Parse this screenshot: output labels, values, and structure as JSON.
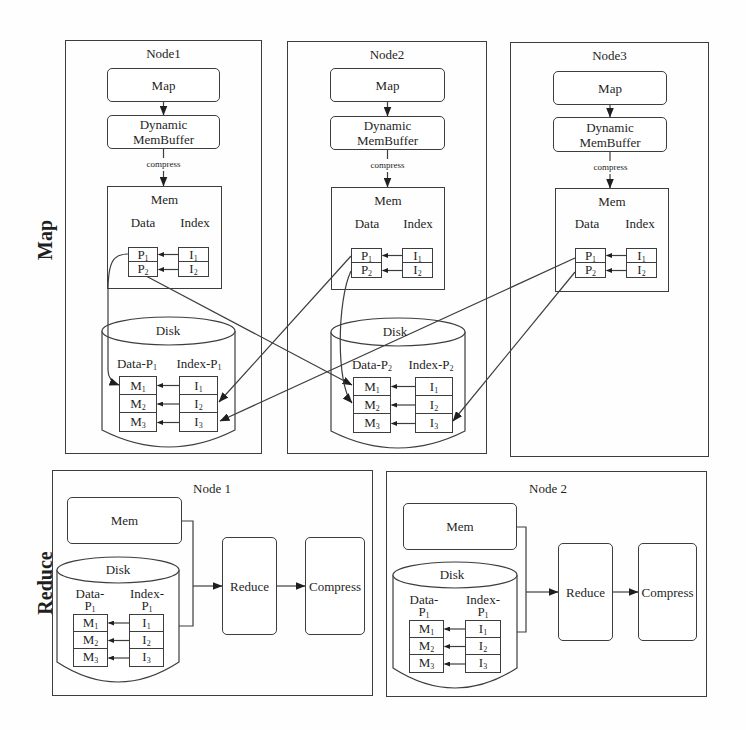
{
  "map_phase": {
    "label": "Map",
    "nodes": [
      {
        "title": "Node1",
        "map": "Map",
        "buffer": {
          "line1": "Dynamic",
          "line2": "MemBuffer"
        },
        "compress": "compress",
        "mem": {
          "title": "Mem",
          "data_label": "Data",
          "index_label": "Index",
          "data": [
            {
              "base": "P",
              "sub": "1"
            },
            {
              "base": "P",
              "sub": "2"
            }
          ],
          "index": [
            {
              "base": "I",
              "sub": "1"
            },
            {
              "base": "I",
              "sub": "2"
            }
          ]
        },
        "disk": {
          "title": "Disk",
          "data_label": {
            "base": "Data-P",
            "sub": "1"
          },
          "index_label": {
            "base": "Index-P",
            "sub": "1"
          },
          "data": [
            {
              "base": "M",
              "sub": "1"
            },
            {
              "base": "M",
              "sub": "2"
            },
            {
              "base": "M",
              "sub": "3"
            }
          ],
          "index": [
            {
              "base": "I",
              "sub": "1"
            },
            {
              "base": "I",
              "sub": "2"
            },
            {
              "base": "I",
              "sub": "3"
            }
          ]
        }
      },
      {
        "title": "Node2",
        "map": "Map",
        "buffer": {
          "line1": "Dynamic",
          "line2": "MemBuffer"
        },
        "compress": "compress",
        "mem": {
          "title": "Mem",
          "data_label": "Data",
          "index_label": "Index",
          "data": [
            {
              "base": "P",
              "sub": "1"
            },
            {
              "base": "P",
              "sub": "2"
            }
          ],
          "index": [
            {
              "base": "I",
              "sub": "1"
            },
            {
              "base": "I",
              "sub": "2"
            }
          ]
        },
        "disk": {
          "title": "Disk",
          "data_label": {
            "base": "Data-P",
            "sub": "2"
          },
          "index_label": {
            "base": "Index-P",
            "sub": "2"
          },
          "data": [
            {
              "base": "M",
              "sub": "1"
            },
            {
              "base": "M",
              "sub": "2"
            },
            {
              "base": "M",
              "sub": "3"
            }
          ],
          "index": [
            {
              "base": "I",
              "sub": "1"
            },
            {
              "base": "I",
              "sub": "2"
            },
            {
              "base": "I",
              "sub": "3"
            }
          ]
        }
      },
      {
        "title": "Node3",
        "map": "Map",
        "buffer": {
          "line1": "Dynamic",
          "line2": "MemBuffer"
        },
        "compress": "compress",
        "mem": {
          "title": "Mem",
          "data_label": "Data",
          "index_label": "Index",
          "data": [
            {
              "base": "P",
              "sub": "1"
            },
            {
              "base": "P",
              "sub": "2"
            }
          ],
          "index": [
            {
              "base": "I",
              "sub": "1"
            },
            {
              "base": "I",
              "sub": "2"
            }
          ]
        }
      }
    ]
  },
  "reduce_phase": {
    "label": "Reduce",
    "nodes": [
      {
        "title": "Node 1",
        "mem": "Mem",
        "disk": {
          "title": "Disk",
          "data_label": {
            "line1": "Data-",
            "base": "P",
            "sub": "1"
          },
          "index_label": {
            "line1": "Index-",
            "base": "P",
            "sub": "1"
          },
          "data": [
            {
              "base": "M",
              "sub": "1"
            },
            {
              "base": "M",
              "sub": "2"
            },
            {
              "base": "M",
              "sub": "3"
            }
          ],
          "index": [
            {
              "base": "I",
              "sub": "1"
            },
            {
              "base": "I",
              "sub": "2"
            },
            {
              "base": "I",
              "sub": "3"
            }
          ]
        },
        "reduce": "Reduce",
        "compress": "Compress"
      },
      {
        "title": "Node 2",
        "mem": "Mem",
        "disk": {
          "title": "Disk",
          "data_label": {
            "line1": "Data-",
            "base": "P",
            "sub": "1"
          },
          "index_label": {
            "line1": "Index-",
            "base": "P",
            "sub": "1"
          },
          "data": [
            {
              "base": "M",
              "sub": "1"
            },
            {
              "base": "M",
              "sub": "2"
            },
            {
              "base": "M",
              "sub": "3"
            }
          ],
          "index": [
            {
              "base": "I",
              "sub": "1"
            },
            {
              "base": "I",
              "sub": "2"
            },
            {
              "base": "I",
              "sub": "3"
            }
          ]
        },
        "reduce": "Reduce",
        "compress": "Compress"
      }
    ]
  },
  "flows": [
    {
      "from": "Node1 Mem P1",
      "to": "Node1 Disk M1"
    },
    {
      "from": "Node1 Mem P2",
      "to": "Node2 Disk M1"
    },
    {
      "from": "Node2 Mem P1",
      "to": "Node1 Disk I2"
    },
    {
      "from": "Node2 Mem P2",
      "to": "Node2 Disk M2"
    },
    {
      "from": "Node3 Mem P1",
      "to": "Node1 Disk I3"
    },
    {
      "from": "Node3 Mem P2",
      "to": "Node2 Disk I3"
    }
  ],
  "colors": {
    "line": "#3d3d3d",
    "background": "#fefefe",
    "text": "#1f1f1f"
  }
}
